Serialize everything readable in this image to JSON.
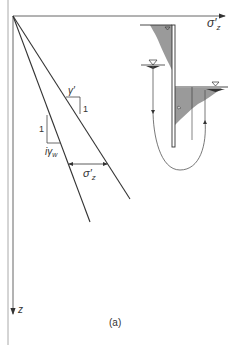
{
  "figure": {
    "panel_label": "(a)",
    "axes": {
      "horizontal_label": "σ′z",
      "horizontal_label_main": "σ′",
      "horizontal_label_sub": "z",
      "vertical_label": "z"
    },
    "slope_upper": {
      "rise_label": "1",
      "run_label": "γ′"
    },
    "slope_lower": {
      "rise_label": "1",
      "run_label": "iγw",
      "run_label_main": "iγ",
      "run_label_sub": "w"
    },
    "dimension": {
      "label_main": "σ′",
      "label_sub": "z"
    },
    "inset": {
      "description": "sheet pile wall with upstream and downstream water tables and seepage flow line",
      "water_table_symbol": "▽"
    },
    "colors": {
      "line": "#333333",
      "shading": "#9a9a9a",
      "border": "#aaaaaa"
    }
  }
}
